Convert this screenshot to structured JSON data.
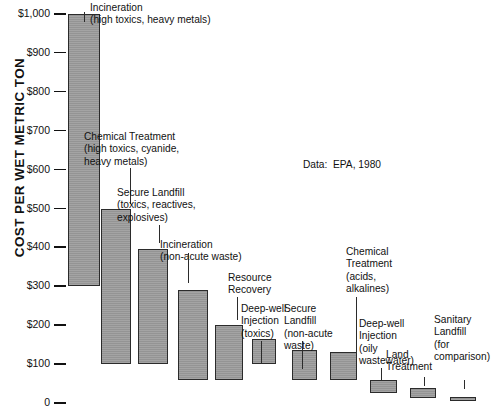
{
  "chart_data": {
    "type": "bar",
    "title": "",
    "xlabel": "",
    "ylabel": "COST PER WET METRIC TON",
    "ylim": [
      0,
      1000
    ],
    "grid": false,
    "legend": "none",
    "annotation": "Data:  EPA, 1980",
    "ytick_labels": [
      "$1,000",
      "$900",
      "$800",
      "$700",
      "$600",
      "$500",
      "$400",
      "$300",
      "$200",
      "$100",
      "0"
    ],
    "ytick_values": [
      1000,
      900,
      800,
      700,
      600,
      500,
      400,
      300,
      200,
      100,
      0
    ],
    "value_unit": "dollars per wet metric ton",
    "note": "Each bar is a floating range bar showing the low-to-high cost range for a disposal method.",
    "categories": [
      "Incineration (high toxics, heavy metals)",
      "Chemical Treatment (high toxics, cyanide, heavy metals)",
      "Secure Landfill (toxics, reactives, explosives)",
      "Incineration (non-acute waste)",
      "Resource Recovery",
      "Deep-well Injection (toxics)",
      "Secure Landfill (non-acute waste)",
      "Chemical Treatment (acids, alkalines)",
      "Deep-well Injection (oily wastewater)",
      "Land Treatment",
      "Sanitary Landfill (for comparison)"
    ],
    "bars": [
      {
        "label_lines": [
          "Incineration",
          "(high toxics, heavy metals)"
        ],
        "low": 300,
        "high": 1000
      },
      {
        "label_lines": [
          "Chemical Treatment",
          "(high toxics, cyanide,",
          "heavy metals)"
        ],
        "low": 100,
        "high": 500
      },
      {
        "label_lines": [
          "Secure Landfill",
          "(toxics, reactives,",
          "explosives)"
        ],
        "low": 100,
        "high": 395
      },
      {
        "label_lines": [
          "Incineration",
          "(non-acute waste)"
        ],
        "low": 60,
        "high": 290
      },
      {
        "label_lines": [
          "Resource",
          "Recovery"
        ],
        "low": 60,
        "high": 200
      },
      {
        "label_lines": [
          "Deep-well",
          "Injection",
          "(toxics)"
        ],
        "low": 100,
        "high": 165
      },
      {
        "label_lines": [
          "Secure",
          "Landfill",
          "(non-acute",
          "waste)"
        ],
        "low": 60,
        "high": 135
      },
      {
        "label_lines": [
          "Chemical",
          "Treatment",
          "(acids,",
          "alkalines)"
        ],
        "low": 60,
        "high": 130
      },
      {
        "label_lines": [
          "Deep-well",
          "Injection",
          "(oily",
          "wastewater)"
        ],
        "low": 25,
        "high": 60
      },
      {
        "label_lines": [
          "Land",
          "Treatment"
        ],
        "low": 12,
        "high": 38
      },
      {
        "label_lines": [
          "Sanitary",
          "Landfill",
          "(for",
          "comparison)"
        ],
        "low": 5,
        "high": 15
      }
    ],
    "colors": {
      "bar_fill": "#9a9a9a",
      "bar_edge": "#2b2b2b",
      "text": "#111111",
      "background": "#ffffff"
    }
  }
}
